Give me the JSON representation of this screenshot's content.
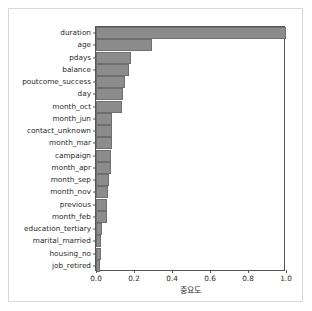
{
  "chart_data": {
    "type": "bar",
    "orientation": "horizontal",
    "title": "",
    "xlabel": "중요도",
    "ylabel": "",
    "xlim": [
      0.0,
      1.0
    ],
    "xticks": [
      "0.0",
      "0.2",
      "0.4",
      "0.6",
      "0.8",
      "1.0"
    ],
    "xtick_values": [
      0.0,
      0.2,
      0.4,
      0.6,
      0.8,
      1.0
    ],
    "grid": false,
    "legend": null,
    "bar_color": "#8c8c8c",
    "bar_edge_color": "#6f6f6f",
    "categories": [
      "duration",
      "age",
      "pdays",
      "balance",
      "poutcome_success",
      "day",
      "month_oct",
      "month_jun",
      "contact_unknown",
      "month_mar",
      "campaign",
      "month_apr",
      "month_sep",
      "month_nov",
      "previous",
      "month_feb",
      "education_tertiary",
      "marital_married",
      "housing_no",
      "job_retired"
    ],
    "values": [
      1.0,
      0.293,
      0.185,
      0.175,
      0.155,
      0.142,
      0.138,
      0.086,
      0.082,
      0.082,
      0.08,
      0.078,
      0.066,
      0.063,
      0.059,
      0.056,
      0.033,
      0.028,
      0.025,
      0.023
    ]
  }
}
